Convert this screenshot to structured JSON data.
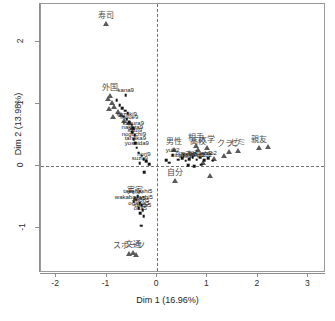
{
  "chart_data": {
    "type": "scatter",
    "title": "",
    "xlabel": "Dim 1 (16.96%)",
    "ylabel": "Dim 2 (13.98%)",
    "xlim": [
      -2.3,
      3.35
    ],
    "ylim": [
      -1.72,
      2.62
    ],
    "xticks": [
      -2,
      -1,
      0,
      1,
      2,
      3
    ],
    "xticklabels": [
      "-2",
      "-1",
      "0",
      "1",
      "2",
      "3"
    ],
    "yticks": [
      -1,
      0,
      1,
      2
    ],
    "yticklabels": [
      "-1",
      "0",
      "1",
      "2"
    ],
    "grid": false,
    "reference_lines": {
      "vertical_x": 0,
      "horizontal_y": 0,
      "style": "dashed"
    },
    "legend": "none",
    "series": [
      {
        "name": "categories",
        "marker": "triangle",
        "color": "#5a5a5a",
        "points": [
          {
            "label": "寿司",
            "x": -1.02,
            "y": 2.29
          },
          {
            "label": "外国",
            "x": -0.93,
            "y": 1.13
          },
          {
            "label": "",
            "x": -0.98,
            "y": 1.08
          },
          {
            "label": "",
            "x": -0.9,
            "y": 1.02
          },
          {
            "label": "",
            "x": -0.86,
            "y": 0.96
          },
          {
            "label": "",
            "x": -0.95,
            "y": 0.93
          },
          {
            "label": "",
            "x": -0.78,
            "y": 0.88
          },
          {
            "label": "",
            "x": -0.88,
            "y": 0.79
          },
          {
            "label": "",
            "x": -0.72,
            "y": 0.83
          },
          {
            "label": "",
            "x": -0.66,
            "y": 0.74
          },
          {
            "label": "",
            "x": -0.56,
            "y": 0.7
          },
          {
            "label": "",
            "x": -0.49,
            "y": 0.62
          },
          {
            "label": "男性",
            "x": 0.34,
            "y": 0.27
          },
          {
            "label": "相手",
            "x": 0.78,
            "y": 0.33
          },
          {
            "label": "高校",
            "x": 0.82,
            "y": 0.27
          },
          {
            "label": "大学",
            "x": 0.99,
            "y": 0.3
          },
          {
            "label": "クラブ",
            "x": 1.42,
            "y": 0.23
          },
          {
            "label": "ゼミ",
            "x": 1.6,
            "y": 0.25
          },
          {
            "label": "親友",
            "x": 2.02,
            "y": 0.3
          },
          {
            "label": "",
            "x": 2.2,
            "y": 0.31
          },
          {
            "label": "",
            "x": 1.33,
            "y": 0.17
          },
          {
            "label": "",
            "x": 1.12,
            "y": 0.12
          },
          {
            "label": "",
            "x": 0.92,
            "y": 0.06
          },
          {
            "label": "",
            "x": 1.05,
            "y": -0.16
          },
          {
            "label": "自分",
            "x": 0.36,
            "y": -0.24
          },
          {
            "label": "実家",
            "x": -0.44,
            "y": -0.52
          },
          {
            "label": "スポーツ",
            "x": -0.55,
            "y": -1.42
          },
          {
            "label": "文通",
            "x": -0.48,
            "y": -1.4
          },
          {
            "label": "",
            "x": -0.41,
            "y": -1.43
          }
        ]
      },
      {
        "name": "individuals",
        "marker": "square",
        "color": "#141414",
        "points": [
          {
            "label": "kana9",
            "x": -0.62,
            "y": 1.15
          },
          {
            "label": "",
            "x": -0.8,
            "y": 1.07
          },
          {
            "label": "",
            "x": -0.74,
            "y": 0.99
          },
          {
            "label": "",
            "x": -0.69,
            "y": 0.94
          },
          {
            "label": "",
            "x": -0.63,
            "y": 0.9
          },
          {
            "label": "",
            "x": -0.58,
            "y": 0.86
          },
          {
            "label": "",
            "x": -0.66,
            "y": 0.8
          },
          {
            "label": "suzuki9",
            "x": -0.6,
            "y": 0.76
          },
          {
            "label": "inoue9",
            "x": -0.55,
            "y": 0.71
          },
          {
            "label": "",
            "x": -0.5,
            "y": 0.67
          },
          {
            "label": "kimura9",
            "x": -0.47,
            "y": 0.62
          },
          {
            "label": "nakata9",
            "x": -0.49,
            "y": 0.55
          },
          {
            "label": "sato9",
            "x": -0.44,
            "y": 0.5
          },
          {
            "label": "noguchi9",
            "x": -0.46,
            "y": 0.44
          },
          {
            "label": "tanaka9",
            "x": -0.43,
            "y": 0.37
          },
          {
            "label": "yoshida9",
            "x": -0.4,
            "y": 0.3
          },
          {
            "label": "",
            "x": -0.36,
            "y": 0.22
          },
          {
            "label": "",
            "x": -0.3,
            "y": 0.17
          },
          {
            "label": "hori9",
            "x": -0.26,
            "y": 0.12
          },
          {
            "label": "suzu9",
            "x": -0.34,
            "y": 0.05
          },
          {
            "label": "",
            "x": -0.22,
            "y": 0.08
          },
          {
            "label": "",
            "x": -0.16,
            "y": 0.04
          },
          {
            "label": "",
            "x": -0.25,
            "y": -0.09
          },
          {
            "label": "yuki2",
            "x": 0.31,
            "y": 0.18
          },
          {
            "label": "",
            "x": 0.18,
            "y": 0.1
          },
          {
            "label": "",
            "x": 0.24,
            "y": 0.06
          },
          {
            "label": "mori2",
            "x": 0.42,
            "y": 0.11
          },
          {
            "label": "ono2",
            "x": 0.5,
            "y": 0.13
          },
          {
            "label": "abe2",
            "x": 0.57,
            "y": 0.09
          },
          {
            "label": "kato2",
            "x": 0.64,
            "y": 0.12
          },
          {
            "label": "ito2",
            "x": 0.71,
            "y": 0.15
          },
          {
            "label": "saito2",
            "x": 0.79,
            "y": 0.11
          },
          {
            "label": "hayashi2",
            "x": 0.86,
            "y": 0.14
          },
          {
            "label": "goto2",
            "x": 0.94,
            "y": 0.1
          },
          {
            "label": "endo2",
            "x": 1.02,
            "y": 0.13
          },
          {
            "label": "",
            "x": 1.1,
            "y": 0.09
          },
          {
            "label": "",
            "x": 0.62,
            "y": 0.02
          },
          {
            "label": "",
            "x": 0.74,
            "y": 0.0
          },
          {
            "label": "",
            "x": 0.88,
            "y": 0.03
          },
          {
            "label": "takahashi5",
            "x": -0.38,
            "y": -0.48
          },
          {
            "label": "wakabayashi5",
            "x": -0.46,
            "y": -0.57
          },
          {
            "label": "ota5",
            "x": -0.34,
            "y": -0.59
          },
          {
            "label": "mori5",
            "x": -0.3,
            "y": -0.63
          },
          {
            "label": "ogawa5",
            "x": -0.36,
            "y": -0.67
          },
          {
            "label": "ueda5",
            "x": -0.28,
            "y": -0.71
          },
          {
            "label": "oka5",
            "x": -0.33,
            "y": -0.76
          },
          {
            "label": "",
            "x": -0.26,
            "y": -0.8
          },
          {
            "label": "",
            "x": -0.31,
            "y": -0.96
          }
        ]
      }
    ]
  }
}
